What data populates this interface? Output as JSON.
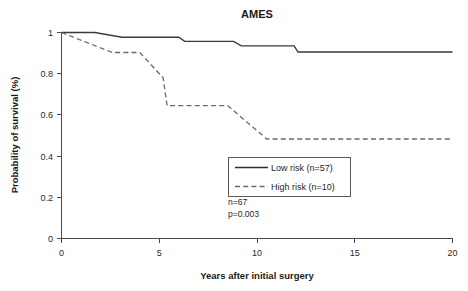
{
  "chart_data": {
    "type": "line",
    "title": "AMES",
    "xlabel": "Years after initial surgery",
    "ylabel": "Probability of survival (%)",
    "xlim": [
      0,
      20
    ],
    "ylim": [
      0,
      1
    ],
    "xticks": [
      "0",
      "5",
      "10",
      "15",
      "20"
    ],
    "xtick_values": [
      0,
      5,
      10,
      15,
      20
    ],
    "yticks": [
      "0",
      "0.2",
      "0.4",
      "0.6",
      "0.8",
      "1"
    ],
    "ytick_values": [
      0,
      0.2,
      0.4,
      0.6,
      0.8,
      1
    ],
    "grid": false,
    "legend_position": "center-right-inside",
    "series": [
      {
        "name": "Low risk (n=57)",
        "style": "solid",
        "color": "#3a3a3a",
        "n": 57,
        "points": [
          [
            0,
            1.0
          ],
          [
            1.7,
            1.0
          ],
          [
            3.1,
            0.977
          ],
          [
            6.0,
            0.977
          ],
          [
            6.3,
            0.957
          ],
          [
            8.8,
            0.957
          ],
          [
            9.2,
            0.935
          ],
          [
            11.9,
            0.935
          ],
          [
            12.1,
            0.905
          ],
          [
            20,
            0.905
          ]
        ]
      },
      {
        "name": "High risk (n=10)",
        "style": "dashed",
        "color": "#6a6a6a",
        "n": 10,
        "points": [
          [
            0,
            1.0
          ],
          [
            2.6,
            0.903
          ],
          [
            4.0,
            0.903
          ],
          [
            5.2,
            0.78
          ],
          [
            5.4,
            0.645
          ],
          [
            8.5,
            0.645
          ],
          [
            10.5,
            0.483
          ],
          [
            20,
            0.483
          ]
        ]
      }
    ],
    "annotations": [
      {
        "text": "n=67"
      },
      {
        "text": "p=0.003"
      }
    ]
  },
  "legend": {
    "entries": [
      {
        "label": "Low risk (n=57)"
      },
      {
        "label": "High risk (n=10)"
      }
    ]
  },
  "stats": {
    "total_n": "n=67",
    "p_value": "p=0.003"
  },
  "colors": {
    "low_risk": "#3a3a3a",
    "high_risk": "#6a6a6a",
    "axis": "#4a4a4a",
    "background": "#ffffff"
  }
}
